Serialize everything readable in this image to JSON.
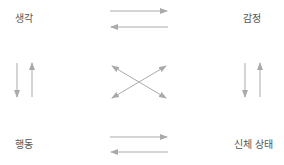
{
  "diagram": {
    "title": "",
    "nodes": [
      {
        "id": "thought",
        "label": "생각",
        "position": "top-left"
      },
      {
        "id": "emotion",
        "label": "감정",
        "position": "top-right"
      },
      {
        "id": "behavior",
        "label": "행동",
        "position": "bottom-left"
      },
      {
        "id": "body",
        "label": "신체 상태",
        "position": "bottom-right"
      }
    ],
    "edges": [
      {
        "from": "thought",
        "to": "emotion"
      },
      {
        "from": "emotion",
        "to": "thought"
      },
      {
        "from": "thought",
        "to": "behavior"
      },
      {
        "from": "behavior",
        "to": "thought"
      },
      {
        "from": "emotion",
        "to": "body"
      },
      {
        "from": "body",
        "to": "emotion"
      },
      {
        "from": "behavior",
        "to": "body"
      },
      {
        "from": "body",
        "to": "behavior"
      },
      {
        "from": "thought",
        "to": "body"
      },
      {
        "from": "body",
        "to": "thought"
      },
      {
        "from": "emotion",
        "to": "behavior"
      },
      {
        "from": "behavior",
        "to": "emotion"
      }
    ],
    "colors": {
      "arrow": "#aaaaaa",
      "label": "#555555",
      "background": "#ffffff"
    }
  }
}
